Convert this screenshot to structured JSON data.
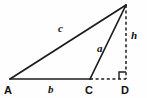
{
  "figure": {
    "kind": "geometry-triangle-with-altitude",
    "background_color": "#fefefe",
    "stroke_color": "#1c1c1c",
    "vertices": {
      "A": {
        "label": "A",
        "x": 10,
        "y": 79
      },
      "C": {
        "label": "C",
        "x": 90,
        "y": 79
      },
      "D": {
        "label": "D",
        "x": 126,
        "y": 79
      },
      "B": {
        "label": "",
        "x": 126,
        "y": 5
      }
    },
    "segments": [
      {
        "name": "base-b",
        "from": "A",
        "to": "C",
        "style": "solid",
        "label": "b"
      },
      {
        "name": "hypotenuse-c",
        "from": "A",
        "to": "B",
        "style": "solid",
        "label": "c"
      },
      {
        "name": "side-a",
        "from": "C",
        "to": "B",
        "style": "solid",
        "label": "a"
      },
      {
        "name": "base-extension",
        "from": "C",
        "to": "D",
        "style": "dashed",
        "label": ""
      },
      {
        "name": "height-h",
        "from": "B",
        "to": "D",
        "style": "dashed",
        "label": "h"
      }
    ],
    "labels": {
      "A": "A",
      "b": "b",
      "C": "C",
      "D": "D",
      "c": "c",
      "a": "a",
      "h": "h"
    },
    "right_angle_marker": {
      "at": "D",
      "size": 7
    }
  }
}
